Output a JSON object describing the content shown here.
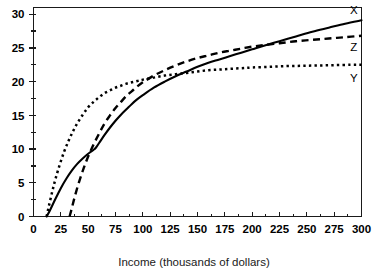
{
  "chart_data": {
    "type": "line",
    "title": "",
    "subtitle": "",
    "xlabel": "Income (thousands of dollars)",
    "ylabel": "",
    "xlim": [
      0,
      300
    ],
    "ylim": [
      0,
      31
    ],
    "grid": false,
    "legend_position": "right-inline-labels",
    "x_ticks": [
      0,
      25,
      50,
      75,
      100,
      125,
      150,
      175,
      200,
      225,
      250,
      275,
      300
    ],
    "x_tick_labels": [
      "0",
      "25",
      "50",
      "75",
      "100",
      "125",
      "150",
      "175",
      "200",
      "225",
      "250",
      "275",
      "300"
    ],
    "x_minor_ticks": [
      12.5,
      37.5,
      62.5,
      87.5,
      112.5,
      137.5,
      162.5,
      187.5,
      212.5,
      237.5,
      262.5,
      287.5
    ],
    "y_ticks": [
      0,
      5,
      10,
      15,
      20,
      25,
      30
    ],
    "y_tick_labels": [
      "0",
      "5",
      "10",
      "15",
      "20",
      "25",
      "30"
    ],
    "y_minor_ticks": [
      2.5,
      7.5,
      12.5,
      17.5,
      22.5,
      27.5
    ],
    "annotations": [
      {
        "text": "X",
        "x": 293,
        "y": 30.0
      },
      {
        "text": "Z",
        "x": 293,
        "y": 24.5
      },
      {
        "text": "Y",
        "x": 293,
        "y": 20.0
      }
    ],
    "series": [
      {
        "name": "X",
        "label": "X",
        "style": "solid",
        "color": "#000000",
        "x": [
          12,
          15,
          20,
          25,
          30,
          35,
          40,
          45,
          50,
          55,
          57,
          60,
          65,
          70,
          75,
          80,
          85,
          90,
          95,
          100,
          110,
          120,
          130,
          140,
          150,
          160,
          170,
          180,
          190,
          200,
          210,
          225,
          240,
          255,
          270,
          285,
          300
        ],
        "y": [
          0,
          0.9,
          2.6,
          4.2,
          5.6,
          6.8,
          7.8,
          8.6,
          9.3,
          9.9,
          10.2,
          10.9,
          12.1,
          13.2,
          14.2,
          15.1,
          15.9,
          16.7,
          17.4,
          18.0,
          19.1,
          20.0,
          20.8,
          21.5,
          22.2,
          22.8,
          23.3,
          23.8,
          24.3,
          24.8,
          25.3,
          26.0,
          26.7,
          27.4,
          28.0,
          28.6,
          29.1
        ]
      },
      {
        "name": "Z",
        "label": "Z",
        "style": "dashed",
        "color": "#000000",
        "x": [
          33,
          35,
          38,
          42,
          46,
          50,
          55,
          60,
          65,
          70,
          75,
          80,
          85,
          90,
          95,
          100,
          110,
          120,
          130,
          140,
          150,
          160,
          170,
          180,
          190,
          200,
          210,
          225,
          240,
          255,
          270,
          285,
          300
        ],
        "y": [
          0,
          1.2,
          3.1,
          5.3,
          7.2,
          8.9,
          10.7,
          12.3,
          13.8,
          15.0,
          16.1,
          17.0,
          17.9,
          18.6,
          19.3,
          19.9,
          20.9,
          21.7,
          22.4,
          23.0,
          23.5,
          23.9,
          24.3,
          24.6,
          24.9,
          25.2,
          25.4,
          25.7,
          26.0,
          26.2,
          26.4,
          26.6,
          26.8
        ]
      },
      {
        "name": "Y",
        "label": "Y",
        "style": "dotted",
        "color": "#000000",
        "x": [
          12,
          14,
          17,
          20,
          24,
          28,
          32,
          36,
          40,
          45,
          50,
          55,
          60,
          65,
          70,
          75,
          80,
          85,
          90,
          95,
          100,
          110,
          120,
          130,
          140,
          150,
          160,
          170,
          180,
          190,
          200,
          215,
          230,
          245,
          260,
          275,
          290,
          300
        ],
        "y": [
          0,
          1.5,
          3.6,
          5.5,
          7.7,
          9.6,
          11.2,
          12.6,
          13.8,
          15.1,
          16.2,
          17.0,
          17.7,
          18.3,
          18.7,
          19.1,
          19.4,
          19.7,
          19.9,
          20.1,
          20.3,
          20.6,
          20.9,
          21.1,
          21.3,
          21.5,
          21.7,
          21.8,
          21.9,
          22.0,
          22.1,
          22.2,
          22.3,
          22.35,
          22.4,
          22.45,
          22.5,
          22.5
        ]
      }
    ]
  }
}
